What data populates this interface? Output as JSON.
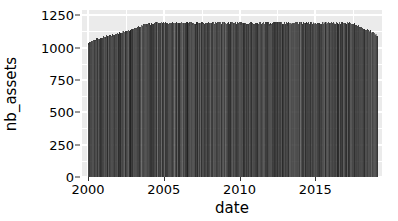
{
  "chart_data": {
    "type": "bar",
    "title": "",
    "subtitle": "",
    "xlabel": "date",
    "ylabel": "nb_assets",
    "grid": true,
    "legend": false,
    "legend_position": "none",
    "xlim": [
      1999.6,
      2019.4
    ],
    "ylim": [
      0,
      1290
    ],
    "x_ticks": [
      2000,
      2005,
      2010,
      2015
    ],
    "x_tick_labels": [
      "2000",
      "2005",
      "2010",
      "2015"
    ],
    "y_ticks": [
      0,
      250,
      500,
      750,
      1000,
      1250
    ],
    "y_tick_labels": [
      "0",
      "250",
      "500",
      "750",
      "1000",
      "1250"
    ],
    "series_name": "nb_assets",
    "series_color": "#2b2b2b",
    "panel_background": "#ebebeb",
    "grid_color": "#ffffff",
    "note": "Dense daily time series of asset counts plotted as vertical lines; envelope rises from ~1050 in 2000 to a ~1200 plateau from 2004-2017, then declines to ~1100 at the 2019 cutoff.",
    "x": [
      2000.0,
      2000.1,
      2000.2,
      2000.3,
      2000.4,
      2000.5,
      2000.6,
      2000.7,
      2000.8,
      2000.9,
      2001.0,
      2001.1,
      2001.2,
      2001.3,
      2001.4,
      2001.5,
      2001.6,
      2001.7,
      2001.8,
      2001.9,
      2002.0,
      2002.1,
      2002.2,
      2002.3,
      2002.4,
      2002.5,
      2002.6,
      2002.7,
      2002.8,
      2002.9,
      2003.0,
      2003.1,
      2003.2,
      2003.3,
      2003.4,
      2003.5,
      2003.6,
      2003.7,
      2003.8,
      2003.9,
      2004.0,
      2004.1,
      2004.2,
      2004.3,
      2004.4,
      2004.5,
      2004.6,
      2004.7,
      2004.8,
      2004.9,
      2005.0,
      2005.1,
      2005.2,
      2005.3,
      2005.4,
      2005.5,
      2005.6,
      2005.7,
      2005.8,
      2005.9,
      2006.0,
      2006.1,
      2006.2,
      2006.3,
      2006.4,
      2006.5,
      2006.6,
      2006.7,
      2006.8,
      2006.9,
      2007.0,
      2007.1,
      2007.2,
      2007.3,
      2007.4,
      2007.5,
      2007.6,
      2007.7,
      2007.8,
      2007.9,
      2008.0,
      2008.1,
      2008.2,
      2008.3,
      2008.4,
      2008.5,
      2008.6,
      2008.7,
      2008.8,
      2008.9,
      2009.0,
      2009.1,
      2009.2,
      2009.3,
      2009.4,
      2009.5,
      2009.6,
      2009.7,
      2009.8,
      2009.9,
      2010.0,
      2010.1,
      2010.2,
      2010.3,
      2010.4,
      2010.5,
      2010.6,
      2010.7,
      2010.8,
      2010.9,
      2011.0,
      2011.1,
      2011.2,
      2011.3,
      2011.4,
      2011.5,
      2011.6,
      2011.7,
      2011.8,
      2011.9,
      2012.0,
      2012.1,
      2012.2,
      2012.3,
      2012.4,
      2012.5,
      2012.6,
      2012.7,
      2012.8,
      2012.9,
      2013.0,
      2013.1,
      2013.2,
      2013.3,
      2013.4,
      2013.5,
      2013.6,
      2013.7,
      2013.8,
      2013.9,
      2014.0,
      2014.1,
      2014.2,
      2014.3,
      2014.4,
      2014.5,
      2014.6,
      2014.7,
      2014.8,
      2014.9,
      2015.0,
      2015.1,
      2015.2,
      2015.3,
      2015.4,
      2015.5,
      2015.6,
      2015.7,
      2015.8,
      2015.9,
      2016.0,
      2016.1,
      2016.2,
      2016.3,
      2016.4,
      2016.5,
      2016.6,
      2016.7,
      2016.8,
      2016.9,
      2017.0,
      2017.1,
      2017.2,
      2017.3,
      2017.4,
      2017.5,
      2017.6,
      2017.7,
      2017.8,
      2017.9,
      2018.0,
      2018.1,
      2018.2,
      2018.3,
      2018.4,
      2018.5,
      2018.6,
      2018.7,
      2018.8,
      2018.9,
      2019.0,
      2019.05
    ],
    "values": [
      1048,
      1052,
      1058,
      1062,
      1068,
      1072,
      1076,
      1080,
      1084,
      1088,
      1090,
      1094,
      1098,
      1100,
      1104,
      1106,
      1110,
      1112,
      1116,
      1118,
      1120,
      1124,
      1126,
      1130,
      1132,
      1136,
      1140,
      1144,
      1148,
      1152,
      1156,
      1160,
      1164,
      1168,
      1172,
      1176,
      1180,
      1184,
      1186,
      1190,
      1192,
      1194,
      1196,
      1196,
      1198,
      1198,
      1200,
      1200,
      1200,
      1200,
      1200,
      1200,
      1200,
      1200,
      1200,
      1200,
      1200,
      1202,
      1202,
      1202,
      1202,
      1202,
      1202,
      1202,
      1202,
      1202,
      1202,
      1202,
      1202,
      1202,
      1202,
      1202,
      1200,
      1200,
      1200,
      1200,
      1200,
      1200,
      1200,
      1200,
      1200,
      1200,
      1200,
      1200,
      1200,
      1200,
      1200,
      1200,
      1200,
      1200,
      1200,
      1200,
      1200,
      1200,
      1200,
      1200,
      1200,
      1200,
      1200,
      1200,
      1200,
      1200,
      1200,
      1200,
      1200,
      1200,
      1200,
      1200,
      1200,
      1200,
      1200,
      1200,
      1200,
      1200,
      1200,
      1200,
      1200,
      1200,
      1200,
      1200,
      1200,
      1200,
      1200,
      1200,
      1200,
      1200,
      1200,
      1200,
      1200,
      1200,
      1200,
      1200,
      1200,
      1200,
      1200,
      1200,
      1200,
      1200,
      1200,
      1200,
      1200,
      1200,
      1200,
      1200,
      1200,
      1200,
      1200,
      1200,
      1200,
      1200,
      1200,
      1200,
      1200,
      1200,
      1200,
      1200,
      1200,
      1200,
      1200,
      1200,
      1200,
      1200,
      1200,
      1200,
      1200,
      1200,
      1200,
      1200,
      1200,
      1200,
      1200,
      1200,
      1198,
      1196,
      1194,
      1192,
      1188,
      1184,
      1180,
      1176,
      1170,
      1164,
      1158,
      1152,
      1146,
      1140,
      1134,
      1128,
      1122,
      1114,
      1106,
      1098
    ]
  }
}
